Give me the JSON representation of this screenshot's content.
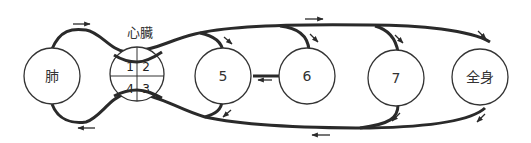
{
  "diagram": {
    "heart_label": "心臓",
    "heart_chambers": [
      "1",
      "2",
      "4",
      "3"
    ],
    "nodes": {
      "lung": "肺",
      "n5": "5",
      "n6": "6",
      "n7": "7",
      "body": "全身"
    },
    "stroke_color": "#2a2a2a"
  }
}
